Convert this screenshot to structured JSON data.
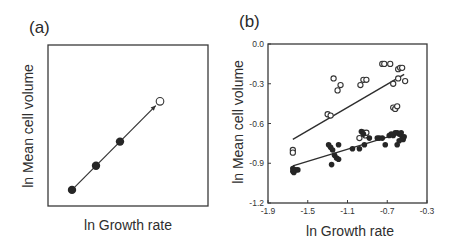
{
  "panels": {
    "a": {
      "label": "(a)",
      "xlabel": "ln Growth rate",
      "ylabel": "ln Mean cell volume"
    },
    "b": {
      "label": "(b)",
      "xlabel": "ln Growth rate",
      "ylabel": "ln Mean cell volume"
    }
  },
  "chart_data": [
    {
      "type": "line",
      "title": "(a)",
      "xlabel": "ln Growth rate",
      "ylabel": "ln Mean cell volume",
      "schematic": true,
      "grid": false,
      "series": [
        {
          "name": "filled",
          "marker": "filled-circle",
          "points": [
            [
              0.15,
              0.1
            ],
            [
              0.3,
              0.25
            ],
            [
              0.45,
              0.4
            ]
          ]
        },
        {
          "name": "open (predicted)",
          "marker": "open-circle",
          "points": [
            [
              0.7,
              0.65
            ]
          ]
        }
      ],
      "annotations": [
        "arrow extending the filled-point line toward the open circle"
      ]
    },
    {
      "type": "scatter",
      "title": "(b)",
      "xlabel": "ln Growth rate",
      "ylabel": "ln Mean cell volume",
      "xlim": [
        -1.9,
        -0.3
      ],
      "ylim": [
        -1.2,
        0.0
      ],
      "xticks": [
        -1.9,
        -1.5,
        -1.1,
        -0.7,
        -0.3
      ],
      "xtick_labels": [
        "-1.9",
        "-1.5",
        "-1.1",
        "-0.7",
        "-0.3"
      ],
      "yticks": [
        0.0,
        -0.3,
        -0.6,
        -0.9,
        -1.2
      ],
      "ytick_labels": [
        "0.0",
        "-0.3",
        "-0.6",
        "-0.9",
        "-1.2"
      ],
      "grid": false,
      "legend": null,
      "series": [
        {
          "name": "open circles",
          "marker": "open-circle",
          "points": [
            [
              -1.65,
              -0.8
            ],
            [
              -1.65,
              -0.82
            ],
            [
              -1.24,
              -0.26
            ],
            [
              -1.2,
              -0.35
            ],
            [
              -1.17,
              -0.31
            ],
            [
              -1.3,
              -0.53
            ],
            [
              -1.27,
              -0.54
            ],
            [
              -0.97,
              -0.31
            ],
            [
              -0.94,
              -0.27
            ],
            [
              -0.91,
              -0.27
            ],
            [
              -0.75,
              -0.15
            ],
            [
              -0.73,
              -0.15
            ],
            [
              -0.67,
              -0.15
            ],
            [
              -0.59,
              -0.19
            ],
            [
              -0.57,
              -0.18
            ],
            [
              -0.55,
              -0.18
            ],
            [
              -0.64,
              -0.3
            ],
            [
              -0.59,
              -0.26
            ],
            [
              -0.52,
              -0.28
            ],
            [
              -0.64,
              -0.48
            ],
            [
              -0.62,
              -0.49
            ],
            [
              -0.6,
              -0.47
            ],
            [
              -0.98,
              -0.71
            ],
            [
              -0.94,
              -0.67
            ],
            [
              -0.92,
              -0.69
            ],
            [
              -0.91,
              -0.67
            ]
          ],
          "fit_line": [
            [
              -1.65,
              -0.72
            ],
            [
              -0.53,
              -0.23
            ]
          ]
        },
        {
          "name": "filled circles",
          "marker": "filled-circle",
          "points": [
            [
              -1.65,
              -0.94
            ],
            [
              -1.65,
              -0.96
            ],
            [
              -1.64,
              -0.97
            ],
            [
              -1.62,
              -0.95
            ],
            [
              -1.6,
              -0.95
            ],
            [
              -1.29,
              -0.76
            ],
            [
              -1.27,
              -0.78
            ],
            [
              -1.25,
              -0.8
            ],
            [
              -1.19,
              -0.76
            ],
            [
              -1.23,
              -0.84
            ],
            [
              -1.21,
              -0.86
            ],
            [
              -1.19,
              -0.87
            ],
            [
              -1.26,
              -0.91
            ],
            [
              -1.05,
              -0.79
            ],
            [
              -0.98,
              -0.79
            ],
            [
              -0.93,
              -0.76
            ],
            [
              -0.96,
              -0.66
            ],
            [
              -0.94,
              -0.68
            ],
            [
              -0.88,
              -0.71
            ],
            [
              -0.8,
              -0.71
            ],
            [
              -0.78,
              -0.71
            ],
            [
              -0.75,
              -0.71
            ],
            [
              -0.72,
              -0.76
            ],
            [
              -0.68,
              -0.69
            ],
            [
              -0.66,
              -0.68
            ],
            [
              -0.64,
              -0.69
            ],
            [
              -0.62,
              -0.67
            ],
            [
              -0.6,
              -0.67
            ],
            [
              -0.58,
              -0.68
            ],
            [
              -0.56,
              -0.67
            ],
            [
              -0.55,
              -0.7
            ],
            [
              -0.54,
              -0.72
            ],
            [
              -0.53,
              -0.7
            ],
            [
              -0.6,
              -0.76
            ],
            [
              -0.58,
              -0.73
            ]
          ],
          "fit_line": [
            [
              -1.65,
              -0.92
            ],
            [
              -0.6,
              -0.68
            ]
          ]
        }
      ]
    }
  ]
}
